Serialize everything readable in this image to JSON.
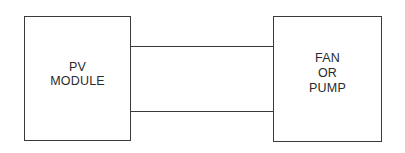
{
  "diagram": {
    "type": "block-diagram",
    "blocks": [
      {
        "id": "pv-module",
        "lines": [
          "PV",
          "MODULE"
        ]
      },
      {
        "id": "load",
        "lines": [
          "FAN",
          "OR",
          "PUMP"
        ]
      }
    ],
    "connections": [
      {
        "from": "pv-module",
        "to": "load",
        "label": ""
      },
      {
        "from": "pv-module",
        "to": "load",
        "label": ""
      }
    ],
    "colors": {
      "stroke": "#3a3a3a",
      "text": "#2a2a2a",
      "background": "#ffffff"
    }
  }
}
